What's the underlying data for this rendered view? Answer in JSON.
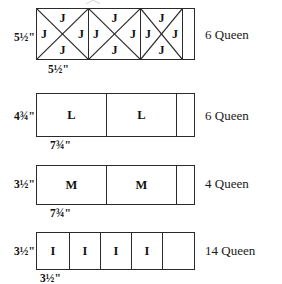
{
  "page": {
    "background_color": "#ffffff",
    "line_color": "#2a2a2a",
    "text_color": "#111111"
  },
  "rows": [
    {
      "id": "row-j",
      "letter": "J",
      "height_label": "5½\"",
      "width_label": "5½\"",
      "quantity": "6 Queen",
      "unit_type": "quarter-square-triangle",
      "unit_count": 3,
      "has_remnant": true,
      "quadrant_letters": [
        "J",
        "J",
        "J",
        "J"
      ]
    },
    {
      "id": "row-l",
      "letter": "L",
      "height_label": "4¾\"",
      "width_label": "7¾\"",
      "quantity": "6 Queen",
      "unit_type": "rectangle",
      "unit_count": 2,
      "has_remnant": true,
      "quadrant_letters": []
    },
    {
      "id": "row-m",
      "letter": "M",
      "height_label": "3½\"",
      "width_label": "7¾\"",
      "quantity": "4 Queen",
      "unit_type": "rectangle",
      "unit_count": 2,
      "has_remnant": true,
      "quadrant_letters": []
    },
    {
      "id": "row-i",
      "letter": "I",
      "height_label": "3½\"",
      "width_label": "3½\"",
      "quantity": "14 Queen",
      "unit_type": "square",
      "unit_count": 4,
      "has_remnant": true,
      "quadrant_letters": []
    }
  ]
}
